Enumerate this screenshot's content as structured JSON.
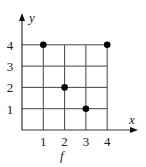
{
  "chart_data": {
    "type": "scatter",
    "title": "",
    "xlabel": "x",
    "ylabel": "y",
    "caption": "f",
    "x_ticks": [
      "1",
      "2",
      "3",
      "4"
    ],
    "y_ticks": [
      "1",
      "2",
      "3",
      "4"
    ],
    "xlim": [
      0,
      4
    ],
    "ylim": [
      0,
      4
    ],
    "grid": true,
    "legend": null,
    "points": [
      {
        "x": 1,
        "y": 4
      },
      {
        "x": 4,
        "y": 4
      },
      {
        "x": 2,
        "y": 2
      },
      {
        "x": 3,
        "y": 1
      }
    ],
    "colors": {
      "axis": "#333333",
      "grid": "#444444",
      "point": "#000000"
    }
  }
}
